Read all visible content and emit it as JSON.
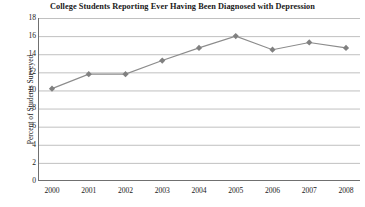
{
  "chart_data": {
    "type": "line",
    "title": "College Students Reporting Ever Having Been Diagnosed with Depression",
    "xlabel": "",
    "ylabel": "Percent of Students Surveyed",
    "categories": [
      "2000",
      "2001",
      "2002",
      "2003",
      "2004",
      "2005",
      "2006",
      "2007",
      "2008"
    ],
    "values": [
      10.2,
      11.8,
      11.8,
      13.3,
      14.7,
      16.0,
      14.5,
      15.3,
      14.7
    ],
    "ylim": [
      0,
      18
    ],
    "ytick_step": 2,
    "yticks": [
      "18",
      "16",
      "14",
      "12",
      "10",
      "8",
      "6",
      "4",
      "2",
      "0"
    ],
    "grid": "horizontal",
    "legend": "none",
    "marker": "diamond",
    "line_color": "#8c8c8c",
    "marker_color": "#808080",
    "grid_color": "#b0b0b0",
    "axis_color": "#707070",
    "text_color": "#1a1a1a"
  }
}
